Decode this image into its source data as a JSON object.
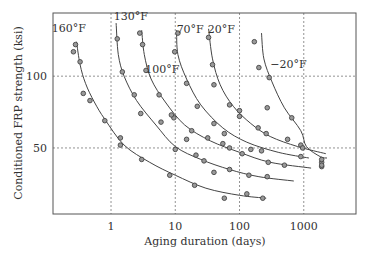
{
  "chart_data": {
    "type": "scatter",
    "title": "",
    "xlabel": "Aging duration (days)",
    "ylabel": "Conditioned FRP strength (ksi)",
    "xscale": "log",
    "xlim": [
      0.125,
      6500
    ],
    "ylim": [
      4,
      144
    ],
    "xticks": [
      1,
      10,
      100,
      1000
    ],
    "xtick_labels": [
      "1",
      "10",
      "100",
      "1000"
    ],
    "yticks": [
      50,
      100
    ],
    "ytick_labels": [
      "50",
      "100"
    ],
    "grid": "dashed at ticks",
    "legend": "none (curve labels)",
    "series": [
      {
        "name": "160°F",
        "label_at": [
          0.12,
          131
        ],
        "points": [
          [
            0.28,
            122
          ],
          [
            0.26,
            117
          ],
          [
            0.33,
            110
          ],
          [
            0.37,
            88
          ],
          [
            0.47,
            83
          ],
          [
            0.8,
            69
          ],
          [
            1.4,
            57
          ],
          [
            1.4,
            52
          ],
          [
            3.0,
            42
          ],
          [
            8.2,
            31
          ],
          [
            20,
            24
          ],
          [
            58,
            15
          ],
          [
            130,
            18
          ],
          [
            230,
            15
          ]
        ],
        "curve": [
          [
            0.29,
            124
          ],
          [
            0.33,
            108
          ],
          [
            0.4,
            95
          ],
          [
            0.55,
            82
          ],
          [
            0.8,
            70
          ],
          [
            1.6,
            52
          ],
          [
            4,
            40
          ],
          [
            10,
            31
          ],
          [
            30,
            22
          ],
          [
            100,
            17
          ],
          [
            260,
            15
          ]
        ]
      },
      {
        "name": "130°F",
        "label_at": [
          1.1,
          139
        ],
        "points": [
          [
            1.25,
            126
          ],
          [
            1.5,
            103
          ],
          [
            2.3,
            87
          ],
          [
            2.9,
            74
          ],
          [
            6.0,
            68
          ],
          [
            10,
            49
          ],
          [
            21,
            45
          ],
          [
            28,
            41
          ],
          [
            70,
            35
          ],
          [
            140,
            31
          ],
          [
            270,
            30
          ],
          [
            9.5,
            71
          ],
          [
            40,
            33
          ]
        ],
        "curve": [
          [
            1.2,
            137
          ],
          [
            1.3,
            115
          ],
          [
            1.6,
            100
          ],
          [
            2.5,
            83
          ],
          [
            5,
            66
          ],
          [
            10,
            51
          ],
          [
            25,
            42
          ],
          [
            70,
            35
          ],
          [
            200,
            30
          ],
          [
            700,
            27
          ]
        ]
      },
      {
        "name": "100°F",
        "label_at": [
          3.4,
          102
        ],
        "points": [
          [
            2.8,
            130
          ],
          [
            3.1,
            122
          ],
          [
            3.5,
            104
          ],
          [
            5.6,
            87
          ],
          [
            8.7,
            73
          ],
          [
            18,
            62
          ],
          [
            32,
            57
          ],
          [
            55,
            53
          ],
          [
            110,
            46
          ],
          [
            280,
            40
          ],
          [
            500,
            38
          ],
          [
            15,
            56
          ]
        ],
        "curve": [
          [
            3.0,
            132
          ],
          [
            3.3,
            115
          ],
          [
            4.2,
            98
          ],
          [
            7,
            82
          ],
          [
            14,
            66
          ],
          [
            35,
            55
          ],
          [
            100,
            47
          ],
          [
            300,
            40
          ],
          [
            1300,
            36
          ]
        ]
      },
      {
        "name": "70°F",
        "label_at": [
          10.5,
          130
        ],
        "points": [
          [
            11,
            130
          ],
          [
            9.8,
            117
          ],
          [
            15,
            95
          ],
          [
            22,
            79
          ],
          [
            40,
            67
          ],
          [
            58,
            60
          ],
          [
            150,
            49
          ],
          [
            220,
            48
          ],
          [
            900,
            44
          ],
          [
            70,
            50
          ]
        ],
        "curve": [
          [
            10.5,
            132
          ],
          [
            11,
            115
          ],
          [
            15,
            98
          ],
          [
            25,
            80
          ],
          [
            55,
            64
          ],
          [
            130,
            54
          ],
          [
            400,
            47
          ],
          [
            1200,
            43
          ]
        ]
      },
      {
        "name": "20°F",
        "label_at": [
          32,
          130
        ],
        "points": [
          [
            33,
            127
          ],
          [
            38,
            108
          ],
          [
            40,
            94
          ],
          [
            70,
            80
          ],
          [
            100,
            76
          ],
          [
            100,
            72
          ],
          [
            195,
            64
          ],
          [
            260,
            60
          ],
          [
            560,
            56
          ],
          [
            900,
            52
          ],
          [
            1900,
            40
          ],
          [
            1900,
            37
          ]
        ],
        "curve": [
          [
            33,
            133
          ],
          [
            38,
            112
          ],
          [
            50,
            94
          ],
          [
            80,
            79
          ],
          [
            150,
            67
          ],
          [
            300,
            58
          ],
          [
            800,
            51
          ],
          [
            2200,
            46
          ]
        ]
      },
      {
        "name": "-20°F",
        "label_at": [
          300,
          106
        ],
        "points": [
          [
            170,
            124
          ],
          [
            200,
            106
          ],
          [
            290,
            99
          ],
          [
            270,
            78
          ],
          [
            650,
            71
          ],
          [
            960,
            50
          ],
          [
            1900,
            42
          ],
          [
            1900,
            38
          ]
        ],
        "curve": [
          [
            220,
            130
          ],
          [
            240,
            112
          ],
          [
            320,
            96
          ],
          [
            500,
            78
          ],
          [
            900,
            62
          ],
          [
            1100,
            51
          ],
          [
            1800,
            44
          ],
          [
            2300,
            43
          ]
        ]
      }
    ]
  }
}
